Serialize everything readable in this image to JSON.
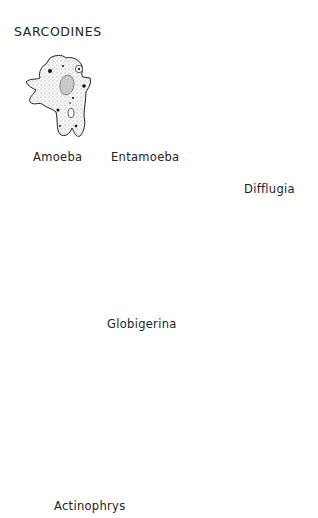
{
  "diagram": {
    "title": "SARCODINES",
    "organisms": [
      {
        "name": "Amoeba"
      },
      {
        "name": "Entamoeba"
      },
      {
        "name": "Difflugia"
      },
      {
        "name": "Globigerina"
      },
      {
        "name": "Actinophrys"
      }
    ],
    "colors": {
      "ink": "#1a1a1a",
      "stipple_fill": "#f2f2f2",
      "entamoeba_cyto": "#e6e6e6",
      "entamoeba_inclusion": "#b8b8b8",
      "background": "#ffffff"
    }
  }
}
